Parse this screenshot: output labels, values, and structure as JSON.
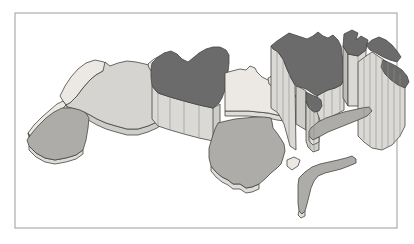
{
  "figure": {
    "kind": "3d-prism-choropleth-map",
    "background_color": "#ffffff",
    "frame_color": "#9c9c9c",
    "outline_color": "#45453f",
    "seam_color": "#8f8d89",
    "palette": {
      "pale": "#ece9e4",
      "light": "#d6d4d0",
      "medium": "#aeaca8",
      "dark": "#6b6b6b",
      "wallLight": "#dbd9d5",
      "wallMid": "#cfcdc9",
      "wallDark": "#bfbdb9",
      "slabPale": "#dfddd9"
    },
    "depicted_regions": [
      {
        "name": "Morocco",
        "shade": "pale",
        "height": "low"
      },
      {
        "name": "Western Sahara",
        "shade": "pale",
        "height": "low"
      },
      {
        "name": "Mauritania",
        "shade": "medium",
        "height": "low"
      },
      {
        "name": "Algeria",
        "shade": "light",
        "height": "low"
      },
      {
        "name": "Tunisia",
        "shade": "pale",
        "height": "low"
      },
      {
        "name": "Libya",
        "shade": "dark",
        "height": "medium"
      },
      {
        "name": "Egypt",
        "shade": "pale",
        "height": "low"
      },
      {
        "name": "Sudan",
        "shade": "medium",
        "height": "low"
      },
      {
        "name": "Levant and Saudi Arabia",
        "shade": "dark",
        "height": "tall"
      },
      {
        "name": "Kuwait",
        "shade": "dark",
        "height": "tall"
      },
      {
        "name": "Gulf states and Oman",
        "shade": "dark",
        "height": "tall"
      },
      {
        "name": "North Yemen",
        "shade": "dark",
        "height": "medium"
      },
      {
        "name": "South Yemen",
        "shade": "medium",
        "height": "low"
      },
      {
        "name": "Djibouti-Eritrea coast",
        "shade": "pale",
        "height": "low"
      },
      {
        "name": "Somalia",
        "shade": "medium",
        "height": "low"
      }
    ]
  },
  "map": {
    "viewbox": "0 0 414 244",
    "frame": {
      "x": 15,
      "y": 13,
      "w": 382,
      "h": 215
    },
    "shapes": [
      {
        "name": "morocco-top",
        "fill": "pale",
        "points": "63,101 60,96 65,86 71,77 78,69 86,63 95,60 104,62 109,66 103,71 96,75 90,80 83,88 77,96 70,103 66,105"
      },
      {
        "name": "western-sahara-top",
        "fill": "pale",
        "points": "63,101 66,105 60,112 52,120 44,128 36,134 30,136 28,133 34,125 42,117 50,110 57,104"
      },
      {
        "name": "western-sahara-wall",
        "fill": "slabPale",
        "points": "28,133 30,136 36,134 44,128 52,120 60,112 66,105 68,109 61,117 53,125 45,133 37,139 29,138"
      },
      {
        "name": "algeria-slab",
        "fill": "wallMid",
        "points": "84,112 90,115 97,119 106,123 116,126 127,129 138,129 148,126 157,122 163,118 163,124 157,128 148,132 138,135 127,135 116,132 106,129 97,125 90,121 84,118"
      },
      {
        "name": "algeria-top",
        "fill": "light",
        "points": "105,62 110,66 118,63 127,61 136,62 145,64 152,66 156,71 158,79 160,88 161,97 162,106 163,114 163,118 157,122 148,126 138,129 127,129 116,126 106,123 97,119 90,115 84,112 75,109 68,107 66,105 70,103 77,96 83,88 90,80 96,75 103,71"
      },
      {
        "name": "tunisia-top",
        "fill": "pale",
        "points": "148,64 154,59 160,56 165,58 164,64 161,70 157,74 152,72 149,68"
      },
      {
        "name": "mauritania-slab",
        "fill": "slabPale",
        "points": "29,146 36,153 45,158 55,160 66,158 76,155 83,150 83,154 76,159 66,162 55,164 45,162 36,157 29,150"
      },
      {
        "name": "mauritania-top",
        "fill": "medium",
        "points": "62,108 72,108 80,110 86,113 89,118 88,128 86,140 83,150 76,155 66,158 55,160 45,158 36,153 29,146 27,140 32,133 38,126 46,118 54,112"
      },
      {
        "name": "libya-front-wall",
        "fill": "wallLight",
        "points": "152,86 158,93 170,97 184,101 199,105 213,108 214,113 214,135 213,141 199,138 184,134 170,130 158,126 152,119"
      },
      {
        "name": "libya-corner-wall",
        "fill": "wallMid",
        "points": "213,108 220,104 220,133 213,141"
      },
      {
        "name": "libya-top",
        "fill": "dark",
        "points": "152,63 158,57 164,53 171,51 177,54 182,59 188,62 193,58 199,53 206,49 213,47 220,47 226,50 229,55 229,63 228,72 227,81 225,90 222,98 219,103 213,108 199,105 184,101 170,97 158,93 152,86 151,77 151,69"
      },
      {
        "name": "egypt-slab",
        "fill": "slabPale",
        "points": "225,111 239,111 248,111 258,112 268,113 277,115 284,116 288,112 288,117 284,121 277,120 268,118 258,117 248,116 239,116 225,116"
      },
      {
        "name": "egypt-top",
        "fill": "pale",
        "points": "225,73 232,71 240,69 246,70 250,66 255,68 257,72 262,77 268,80 274,84 280,87 287,90 293,93 296,96 293,101 290,107 288,112 284,116 277,115 268,113 258,112 248,111 239,111 225,111"
      },
      {
        "name": "levant-strip",
        "fill": "pale",
        "points": "268,78 274,75 278,79 274,88 269,84"
      },
      {
        "name": "sudan-slab",
        "fill": "slabPale",
        "points": "211,166 216,172 222,177 228,180 233,184 240,184 246,188 252,187 259,184 259,189 252,192 246,193 240,189 233,189 228,185 222,182 216,177 211,171"
      },
      {
        "name": "sudan-top",
        "fill": "medium",
        "points": "218,123 226,121 235,119 245,118 255,117 264,117 271,118 272,122 273,128 277,133 281,139 284,144 285,151 283,158 281,164 277,168 271,173 265,179 259,184 252,187 246,188 240,184 233,184 228,180 222,177 216,172 211,166 209,158 209,148 212,138 215,129"
      },
      {
        "name": "eritrea-djibouti-top",
        "fill": "pale",
        "points": "287,160 294,157 300,160 298,166 292,170 287,166"
      },
      {
        "name": "arabia-west-wall",
        "fill": "wallLight",
        "points": "271,46 278,52 283,59 287,69 291,78 295,85 296,150 290,146 284,124 278,113 271,108"
      },
      {
        "name": "arabia-south-wall",
        "fill": "wallMid",
        "points": "296,86 301,88 306,91 306,130 301,127 296,124"
      },
      {
        "name": "north-yemen-wall",
        "fill": "wallMid",
        "points": "306,101 309,108 314,112 319,111 319,150 313,152 308,147 306,141"
      },
      {
        "name": "arabia-mid-wall",
        "fill": "wallLight",
        "points": "317,96 322,93 328,90 335,88 341,85 344,80 344,110 337,114 329,118 321,123 317,112"
      },
      {
        "name": "saudi-levant-top",
        "fill": "dark",
        "points": "271,46 277,41 283,37 289,33 295,35 301,37 307,39 313,36 318,32 323,36 328,38 333,35 338,40 341,46 342,54 343,62 344,70 344,78 341,85 335,88 328,90 322,93 317,96 312,93 306,89 300,87 295,85 291,78 287,69 283,59 278,52 273,49"
      },
      {
        "name": "north-yemen-top",
        "fill": "dark",
        "points": "306,92 312,95 317,97 321,100 322,106 319,111 314,112 309,108 306,101"
      },
      {
        "name": "kuwait-left-wall",
        "fill": "wallDark",
        "points": "343,46 348,54 348,106 343,98"
      },
      {
        "name": "kuwait-right-wall",
        "fill": "wallLight",
        "points": "348,54 358,56 366,50 366,100 358,106 348,106"
      },
      {
        "name": "kuwait-top",
        "fill": "dark",
        "points": "344,34 352,30 358,33 356,40 361,36 368,40 366,50 358,56 348,54 343,46"
      },
      {
        "name": "gulf-wall",
        "fill": "wallLight",
        "points": "358,62 366,56 372,52 378,56 384,60 390,64 396,70 401,76 405,84 405,126 400,136 392,145 382,150 372,148 364,142 358,136"
      },
      {
        "name": "gulf-top-north",
        "fill": "dark",
        "points": "366,45 372,40 379,37 386,40 392,45 397,51 401,57 397,62 390,60 383,57 376,53 370,50"
      },
      {
        "name": "gulf-top-south",
        "fill": "dark",
        "points": "383,60 390,63 396,66 402,70 407,76 409,82 405,88 398,85 391,80 385,74 381,67"
      },
      {
        "name": "south-yemen-top",
        "fill": "medium",
        "points": "311,128 318,122 326,118 335,115 344,112 353,110 362,108 369,107 372,111 367,116 358,120 348,124 338,128 328,132 319,137 313,140 309,136 309,131"
      },
      {
        "name": "south-yemen-wall",
        "fill": "slabPale",
        "points": "309,136 313,140 319,137 319,142 313,145 309,141"
      },
      {
        "name": "somalia-top",
        "fill": "medium",
        "points": "299,178 305,172 312,167 320,164 329,162 338,160 346,158 352,156 356,159 356,163 349,166 341,169 333,171 325,173 318,176 314,181 311,188 309,196 307,204 305,211 302,214 299,211 298,203 298,193 298,185"
      },
      {
        "name": "somalia-tip-wall",
        "fill": "slabPale",
        "points": "299,211 302,214 305,211 305,216 301,218 298,215"
      }
    ],
    "seams": [
      {
        "name": "libya-wall-seam",
        "points": "158,93 158,126"
      },
      {
        "name": "libya-wall-seam",
        "points": "170,97 170,130"
      },
      {
        "name": "libya-wall-seam",
        "points": "184,101 184,134"
      },
      {
        "name": "libya-wall-seam",
        "points": "199,105 199,138"
      },
      {
        "name": "arabia-wall-seam",
        "points": "277,51 277,112"
      },
      {
        "name": "arabia-wall-seam",
        "points": "283,59 283,122"
      },
      {
        "name": "arabia-wall-seam",
        "points": "289,73 289,142"
      },
      {
        "name": "arabia-wall-seam",
        "points": "324,92 324,120"
      },
      {
        "name": "arabia-wall-seam",
        "points": "332,89 332,117"
      },
      {
        "name": "arabia-wall-seam",
        "points": "340,86 340,112"
      },
      {
        "name": "north-yemen-wall-seam",
        "points": "310,106 310,149"
      },
      {
        "name": "north-yemen-wall-seam",
        "points": "314,111 314,151"
      },
      {
        "name": "kuwait-wall-seam",
        "points": "358,56 358,106"
      },
      {
        "name": "gulf-wall-seam",
        "points": "364,58 364,140"
      },
      {
        "name": "gulf-wall-seam",
        "points": "370,54 370,146"
      },
      {
        "name": "gulf-wall-seam",
        "points": "376,55 376,148"
      },
      {
        "name": "gulf-wall-seam",
        "points": "382,58 382,150"
      },
      {
        "name": "gulf-wall-seam",
        "points": "388,62 388,147"
      },
      {
        "name": "gulf-wall-seam",
        "points": "394,68 394,144"
      },
      {
        "name": "gulf-wall-seam",
        "points": "400,74 400,137"
      }
    ]
  }
}
